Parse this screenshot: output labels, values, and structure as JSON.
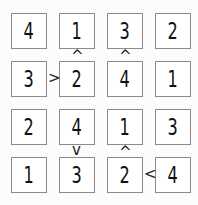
{
  "puzzle": {
    "type": "futoshiki",
    "size": 4,
    "grid": [
      [
        4,
        1,
        3,
        2
      ],
      [
        3,
        2,
        4,
        1
      ],
      [
        2,
        4,
        1,
        3
      ],
      [
        1,
        3,
        2,
        4
      ]
    ],
    "constraints": [
      {
        "between": "r0c1-r1c1",
        "symbol": "^",
        "meaning": "upper < lower"
      },
      {
        "between": "r0c2-r1c2",
        "symbol": "^",
        "meaning": "upper < lower"
      },
      {
        "between": "r1c0-r1c1",
        "symbol": ">",
        "meaning": "left > right"
      },
      {
        "between": "r2c1-r3c1",
        "symbol": "v",
        "meaning": "upper > lower"
      },
      {
        "between": "r2c2-r3c2",
        "symbol": "^",
        "meaning": "upper < lower"
      },
      {
        "between": "r3c2-r3c3",
        "symbol": "<",
        "meaning": "left < right"
      }
    ]
  },
  "cells": {
    "r0c0": "4",
    "r0c1": "1",
    "r0c2": "3",
    "r0c3": "2",
    "r1c0": "3",
    "r1c1": "2",
    "r1c2": "4",
    "r1c3": "1",
    "r2c0": "2",
    "r2c1": "4",
    "r2c2": "1",
    "r2c3": "3",
    "r3c0": "1",
    "r3c1": "3",
    "r3c2": "2",
    "r3c3": "4"
  },
  "signs": {
    "s1": "^",
    "s2": "^",
    "s3": ">",
    "s4": "v",
    "s5": "^",
    "s6": "<"
  }
}
